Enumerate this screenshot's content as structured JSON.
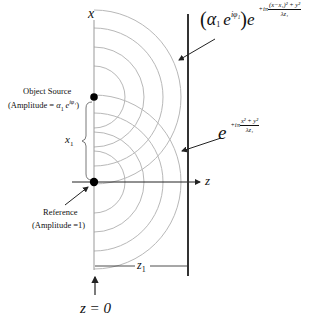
{
  "axes": {
    "x_label": "x",
    "z_label": "z",
    "z1_label": "z",
    "z1_sub": "1",
    "x1_label": "x",
    "x1_sub": "1",
    "z0_label": "z = 0"
  },
  "object_source": {
    "title": "Object Source",
    "amplitude": "(Amplitude  = α₁ e^{iφ₁})",
    "amplitude_prefix": "(Amplitude  = ",
    "amplitude_alpha": "α",
    "amplitude_sub": "1",
    "amplitude_exp": "iφ₁",
    "amplitude_suffix": ")"
  },
  "reference": {
    "title": "Reference",
    "amplitude": "(Amplitude  =1)"
  },
  "equations": {
    "object_wave": {
      "prefix": "(α₁ e^{iφ₁}) e",
      "exp_lead": "+iπ",
      "exp_num": "(x−x₁)² + y²",
      "exp_den": "λz₁"
    },
    "reference_wave": {
      "base": "e",
      "exp_lead": "+iπ",
      "exp_num": "x² + y²",
      "exp_den": "λz₁"
    }
  },
  "colors": {
    "wavefront": "#b8b8b8",
    "axis": "#222222",
    "plate": "#333333"
  }
}
